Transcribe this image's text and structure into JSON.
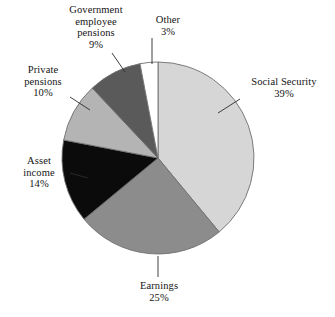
{
  "chart_data": {
    "type": "pie",
    "title": "",
    "subtitle": "",
    "xlabel": "",
    "ylabel": "",
    "legend_position": "none",
    "grid": false,
    "units": "percent",
    "start_angle_deg": 0,
    "direction": "clockwise",
    "total": 100,
    "slices": [
      {
        "name": "Social Security",
        "value": 39,
        "value_label": "39%",
        "color": "#d6d6d6",
        "label_lines": [
          "Social Security",
          "39%"
        ],
        "label_align": "right-of-pie"
      },
      {
        "name": "Earnings",
        "value": 25,
        "value_label": "25%",
        "color": "#8c8c8c",
        "label_lines": [
          "Earnings",
          "25%"
        ],
        "label_align": "below-pie"
      },
      {
        "name": "Asset income",
        "value": 14,
        "value_label": "14%",
        "color": "#0b0b0b",
        "label_lines": [
          "Asset",
          "income",
          "14%"
        ],
        "label_align": "left-of-pie"
      },
      {
        "name": "Private pensions",
        "value": 10,
        "value_label": "10%",
        "color": "#b4b4b4",
        "label_lines": [
          "Private",
          "pensions",
          "10%"
        ],
        "label_align": "left-of-pie"
      },
      {
        "name": "Government employee pensions",
        "value": 9,
        "value_label": "9%",
        "color": "#5a5a5a",
        "label_lines": [
          "Government",
          "employee",
          "pensions",
          "9%"
        ],
        "label_align": "above-pie"
      },
      {
        "name": "Other",
        "value": 3,
        "value_label": "3%",
        "color": "#ffffff",
        "label_lines": [
          "Other",
          "3%"
        ],
        "label_align": "above-pie"
      }
    ],
    "categories": [
      "Social Security",
      "Earnings",
      "Asset income",
      "Private pensions",
      "Government employee pensions",
      "Other"
    ],
    "values": [
      39,
      25,
      14,
      10,
      9,
      3
    ]
  },
  "labels": {
    "social_security": {
      "l1": "Social Security",
      "l2": "39%"
    },
    "earnings": {
      "l1": "Earnings",
      "l2": "25%"
    },
    "asset_income": {
      "l1": "Asset",
      "l2": "income",
      "l3": "14%"
    },
    "private_pensions": {
      "l1": "Private",
      "l2": "pensions",
      "l3": "10%"
    },
    "government_employee_pensions": {
      "l1": "Government",
      "l2": "employee",
      "l3": "pensions",
      "l4": "9%"
    },
    "other": {
      "l1": "Other",
      "l2": "3%"
    }
  },
  "colors": {
    "social_security": "#d6d6d6",
    "earnings": "#8c8c8c",
    "asset_income": "#0b0b0b",
    "private_pensions": "#b4b4b4",
    "government_employee_pensions": "#5a5a5a",
    "other": "#ffffff",
    "outline": "#6f6f6f",
    "leader_line": "#2b2b2b",
    "background": "#ffffff",
    "text": "#141414"
  }
}
